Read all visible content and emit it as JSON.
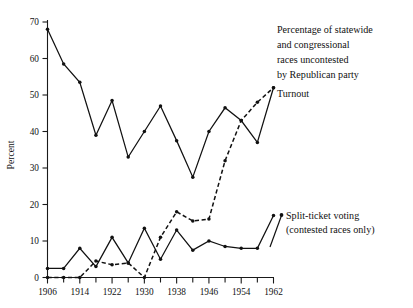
{
  "chart_data": {
    "type": "line",
    "title": "",
    "subtitle": "",
    "xlabel": "",
    "ylabel": "Percent",
    "xlim": [
      1906,
      1962
    ],
    "ylim": [
      0,
      70
    ],
    "grid": false,
    "legend_position": "inline-annotations",
    "x_tick_labels": [
      "1906",
      "1914",
      "1922",
      "1930",
      "1938",
      "1946",
      "1954",
      "1962"
    ],
    "x_tick_values": [
      1906,
      1914,
      1922,
      1930,
      1938,
      1946,
      1954,
      1962
    ],
    "x_minor_tick_values": [
      1910,
      1918,
      1926,
      1934,
      1942,
      1950,
      1958
    ],
    "y_tick_labels": [
      "0",
      "10",
      "20",
      "30",
      "40",
      "50",
      "60",
      "70"
    ],
    "y_tick_values": [
      0,
      10,
      20,
      30,
      40,
      50,
      60,
      70
    ],
    "x": [
      1906,
      1910,
      1914,
      1918,
      1922,
      1926,
      1930,
      1934,
      1938,
      1942,
      1946,
      1950,
      1954,
      1958,
      1962
    ],
    "series": [
      {
        "name": "Turnout",
        "style": "solid",
        "markers": true,
        "values": [
          68.0,
          58.5,
          53.5,
          39.0,
          48.5,
          33.0,
          40.0,
          47.0,
          37.5,
          27.5,
          40.0,
          46.5,
          43.0,
          37.0,
          52.0
        ]
      },
      {
        "name": "Percentage of statewide and congressional races uncontested by Republican party",
        "style": "dashed",
        "markers": true,
        "values": [
          0.0,
          0.0,
          0.0,
          4.5,
          3.5,
          4.0,
          0.0,
          11.0,
          18.0,
          15.5,
          16.0,
          32.0,
          43.0,
          48.0,
          52.0
        ]
      },
      {
        "name": "Split-ticket voting (contested races only)",
        "style": "solid",
        "markers": true,
        "values": [
          2.5,
          2.5,
          8.0,
          3.0,
          11.0,
          4.0,
          13.5,
          5.0,
          13.0,
          7.5,
          10.0,
          8.5,
          8.0,
          8.0,
          17.0
        ]
      }
    ],
    "annotations": [
      {
        "name": "uncontested-label",
        "lines": [
          "Percentage of statewide",
          "and congressional",
          "races uncontested",
          "by Republican party"
        ]
      },
      {
        "name": "turnout-label",
        "lines": [
          "Turnout"
        ]
      },
      {
        "name": "split-ticket-label",
        "lines": [
          "Split-ticket voting",
          "(contested races only)"
        ]
      }
    ],
    "colors": {
      "ink": "#111111",
      "background": "#ffffff"
    }
  }
}
